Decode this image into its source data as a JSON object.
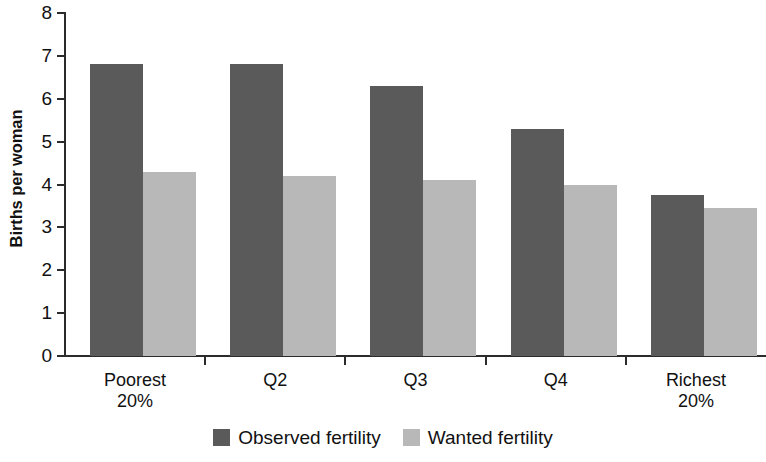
{
  "chart_data": {
    "type": "bar",
    "title": "",
    "subtitle": "",
    "xlabel": "",
    "ylabel": "Births per woman",
    "ylim": [
      0,
      8
    ],
    "ytick_labels": [
      "8",
      "7",
      "6",
      "5",
      "4",
      "3",
      "2",
      "1",
      "0"
    ],
    "ytick_values": [
      8,
      7,
      6,
      5,
      4,
      3,
      2,
      1,
      0
    ],
    "grid": false,
    "legend_position": "bottom-center",
    "categories": [
      "Poorest 20%",
      "Q2",
      "Q3",
      "Q4",
      "Richest 20%"
    ],
    "category_lines": [
      [
        "Poorest",
        "20%"
      ],
      [
        "Q2",
        ""
      ],
      [
        "Q3",
        ""
      ],
      [
        "Q4",
        ""
      ],
      [
        "Richest",
        "20%"
      ]
    ],
    "series": [
      {
        "name": "Observed fertility",
        "color": "#5a5a5a",
        "values": [
          6.8,
          6.8,
          6.3,
          5.3,
          3.75
        ]
      },
      {
        "name": "Wanted fertility",
        "color": "#b8b8b8",
        "values": [
          4.3,
          4.2,
          4.1,
          4.0,
          3.45
        ]
      }
    ]
  },
  "legend": {
    "items": [
      {
        "label": "Observed fertility",
        "color": "#5a5a5a"
      },
      {
        "label": "Wanted fertility",
        "color": "#b8b8b8"
      }
    ]
  },
  "axes": {
    "y_title": "Births per woman",
    "y_labels": [
      "8",
      "7",
      "6",
      "5",
      "4",
      "3",
      "2",
      "1",
      "0"
    ]
  },
  "colors": {
    "observed": "#5a5a5a",
    "wanted": "#b8b8b8",
    "axis": "#2b2b2b",
    "text": "#111111",
    "background": "#ffffff"
  }
}
